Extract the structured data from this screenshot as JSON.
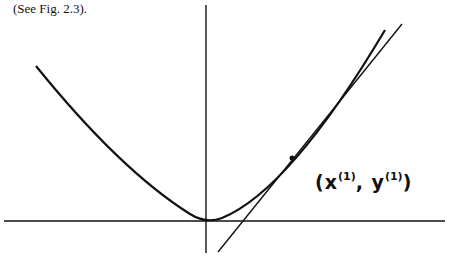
{
  "caption": "(See Fig. 2.3).",
  "figure": {
    "point_label": {
      "open": "(",
      "x": "x",
      "x_sup": "(1)",
      "sep": ", ",
      "y": "y",
      "y_sup": "(1)",
      "close": ")"
    },
    "stroke_color": "#111111"
  }
}
